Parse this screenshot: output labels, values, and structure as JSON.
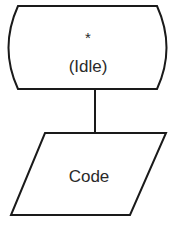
{
  "diagram": {
    "state_node": {
      "symbol": "*",
      "label": "(Idle)"
    },
    "io_node": {
      "label": "Code"
    },
    "colors": {
      "stroke": "#1a1a1a",
      "background": "#ffffff",
      "text": "#2a2a2a"
    }
  }
}
